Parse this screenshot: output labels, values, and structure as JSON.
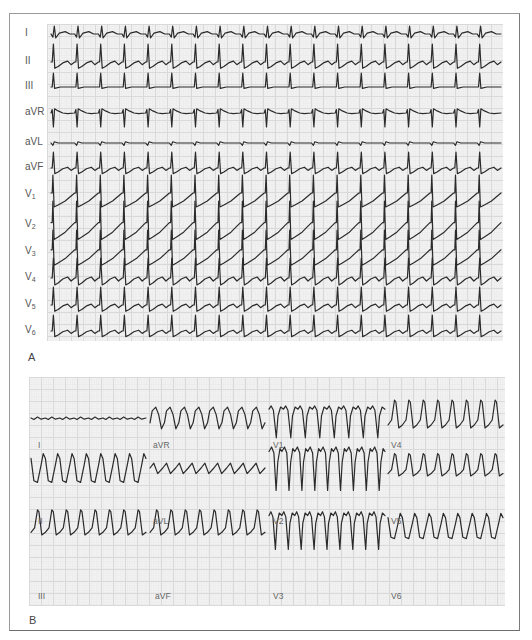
{
  "figure": {
    "panels": [
      {
        "id": "A",
        "letter": "A",
        "layout": "12 leads stacked vertically, continuous rhythm strip",
        "leads": [
          {
            "name": "I",
            "base": "I",
            "sub": "",
            "y": 34,
            "morph": "small_pos",
            "amp": 8
          },
          {
            "name": "II",
            "base": "II",
            "sub": "",
            "y": 62,
            "morph": "tall_pos",
            "amp": 18
          },
          {
            "name": "III",
            "base": "III",
            "sub": "",
            "y": 87,
            "morph": "tall_pos_flat",
            "amp": 14
          },
          {
            "name": "aVR",
            "base": "aVR",
            "sub": "",
            "y": 113,
            "morph": "neg_spike",
            "amp": 14
          },
          {
            "name": "aVL",
            "base": "aVL",
            "sub": "",
            "y": 143,
            "morph": "flat_notch",
            "amp": 4
          },
          {
            "name": "aVF",
            "base": "aVF",
            "sub": "",
            "y": 168,
            "morph": "tall_pos",
            "amp": 16
          },
          {
            "name": "V1",
            "base": "V",
            "sub": "1",
            "y": 195,
            "morph": "tall_pos_st",
            "amp": 20
          },
          {
            "name": "V2",
            "base": "V",
            "sub": "2",
            "y": 225,
            "morph": "tall_pos_st",
            "amp": 24
          },
          {
            "name": "V3",
            "base": "V",
            "sub": "3",
            "y": 252,
            "morph": "tall_pos_st",
            "amp": 22
          },
          {
            "name": "V4",
            "base": "V",
            "sub": "4",
            "y": 278,
            "morph": "tall_pos",
            "amp": 20
          },
          {
            "name": "V5",
            "base": "V",
            "sub": "5",
            "y": 305,
            "morph": "tall_pos",
            "amp": 18
          },
          {
            "name": "V6",
            "base": "V",
            "sub": "6",
            "y": 331,
            "morph": "tall_pos",
            "amp": 16
          }
        ],
        "beats": 19,
        "x_start": 51,
        "x_end": 501
      },
      {
        "id": "B",
        "letter": "B",
        "layout": "3 rows x 4 columns of lead segments",
        "columns": [
          {
            "x0": 31,
            "x1": 146
          },
          {
            "x0": 150,
            "x1": 265
          },
          {
            "x0": 269,
            "x1": 385
          },
          {
            "x0": 388,
            "x1": 503
          }
        ],
        "rows_y": [
          418,
          468,
          526
        ],
        "segments": [
          {
            "lead": "I",
            "row": 0,
            "col": 0,
            "morph": "flat_small",
            "amp": 3,
            "beats": 8,
            "label_x": 38,
            "label_y": 446
          },
          {
            "lead": "aVR",
            "row": 0,
            "col": 1,
            "morph": "rounded_pos",
            "amp": 12,
            "beats": 8,
            "label_x": 153,
            "label_y": 446
          },
          {
            "lead": "V1",
            "row": 0,
            "col": 2,
            "morph": "deep_neg",
            "amp": 22,
            "beats": 8,
            "label_x": 273,
            "label_y": 446
          },
          {
            "lead": "V4",
            "row": 0,
            "col": 3,
            "morph": "tall_spike",
            "amp": 20,
            "beats": 8,
            "label_x": 391,
            "label_y": 446
          },
          {
            "lead": "II",
            "row": 1,
            "col": 0,
            "morph": "rounded_neg",
            "amp": 16,
            "beats": 8,
            "label_x": 38,
            "label_y": 522
          },
          {
            "lead": "aVL",
            "row": 1,
            "col": 1,
            "morph": "small_wave",
            "amp": 8,
            "beats": 9,
            "label_x": 153,
            "label_y": 522
          },
          {
            "lead": "V2",
            "row": 1,
            "col": 2,
            "morph": "deep_neg_big",
            "amp": 30,
            "beats": 9,
            "label_x": 273,
            "label_y": 522
          },
          {
            "lead": "V5",
            "row": 1,
            "col": 3,
            "morph": "tall_spike",
            "amp": 16,
            "beats": 8,
            "label_x": 391,
            "label_y": 522
          },
          {
            "lead": "III",
            "row": 2,
            "col": 0,
            "morph": "tall_spike",
            "amp": 18,
            "beats": 8,
            "label_x": 38,
            "label_y": 597
          },
          {
            "lead": "aVF",
            "row": 2,
            "col": 1,
            "morph": "tall_spike",
            "amp": 18,
            "beats": 8,
            "label_x": 155,
            "label_y": 597
          },
          {
            "lead": "V3",
            "row": 2,
            "col": 2,
            "morph": "deep_neg",
            "amp": 26,
            "beats": 9,
            "label_x": 273,
            "label_y": 597
          },
          {
            "lead": "V6",
            "row": 2,
            "col": 3,
            "morph": "rounded_neg",
            "amp": 14,
            "beats": 8,
            "label_x": 391,
            "label_y": 597
          }
        ]
      }
    ],
    "colors": {
      "trace": "#2b2b2b",
      "grid_major": "#d9d9d9",
      "grid_minor": "#ececec",
      "grid_bg": "#f3f3f3",
      "frame": "#9a9a9a",
      "label": "#555555"
    }
  }
}
